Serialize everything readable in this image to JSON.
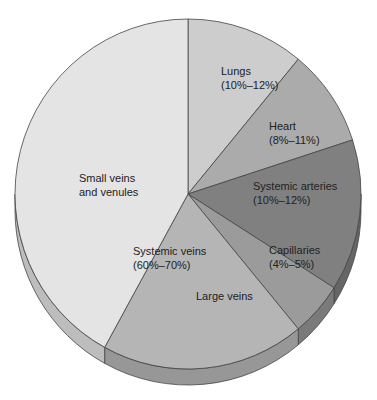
{
  "chart_data": {
    "type": "pie",
    "title": "",
    "style": "3d-tilted",
    "grid": false,
    "legend": "none",
    "group_label": {
      "lines": [
        "Systemic veins",
        "(60%–70%)"
      ],
      "covers": [
        "Small veins and venules",
        "Large veins"
      ]
    },
    "slices": [
      {
        "name": "Lungs",
        "label_lines": [
          "Lungs",
          "(10%–12%)"
        ],
        "range": "10%-12%",
        "value": 11,
        "color": "#cdcdcd",
        "side_color": "#a8a8a8"
      },
      {
        "name": "Heart",
        "label_lines": [
          "Heart",
          "(8%–11%)"
        ],
        "range": "8%-11%",
        "value": 9,
        "color": "#ababab",
        "side_color": "#8a8a8a"
      },
      {
        "name": "Systemic arteries",
        "label_lines": [
          "Systemic arteries",
          "(10%–12%)"
        ],
        "range": "10%-12%",
        "value": 14,
        "color": "#808080",
        "side_color": "#666666"
      },
      {
        "name": "Capillaries",
        "label_lines": [
          "Capillaries",
          "(4%–5%)"
        ],
        "range": "4%-5%",
        "value": 5,
        "color": "#9b9b9b",
        "side_color": "#7a7a7a"
      },
      {
        "name": "Large veins",
        "label_lines": [
          "Large veins"
        ],
        "range": "",
        "value": 19,
        "color": "#b5b5b5",
        "side_color": "#979797"
      },
      {
        "name": "Small veins and venules",
        "label_lines": [
          "Small veins",
          "and venules"
        ],
        "range": "",
        "value": 42,
        "color": "#e4e4e4",
        "side_color": "#bdbdbd"
      }
    ],
    "stroke_color": "#444444"
  }
}
